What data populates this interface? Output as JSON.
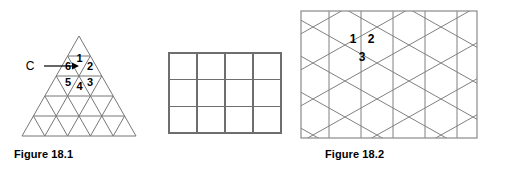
{
  "figures": [
    {
      "id": "figure-18-1",
      "caption": "Figure 18.1",
      "type": "triangular-grid",
      "rows": 5,
      "pointer_label": "C",
      "cell_numbers": [
        "1",
        "2",
        "3",
        "4",
        "5",
        "6"
      ],
      "line_color": "#777777",
      "text_color": "#000000"
    },
    {
      "id": "figure-18-2",
      "caption": "Figure 18.2",
      "type": "square-grid",
      "columns": 4,
      "rows": 3,
      "cell_numbers": [],
      "line_color": "#6e6e6e",
      "text_color": "#000000"
    },
    {
      "id": "figure-18-3",
      "caption": "Figure 18.3",
      "type": "hexagonal-tiling",
      "cell_numbers": [
        "1",
        "2",
        "3"
      ],
      "line_color": "#808080",
      "border_color": "#8a8a8a",
      "text_color": "#000000"
    }
  ]
}
